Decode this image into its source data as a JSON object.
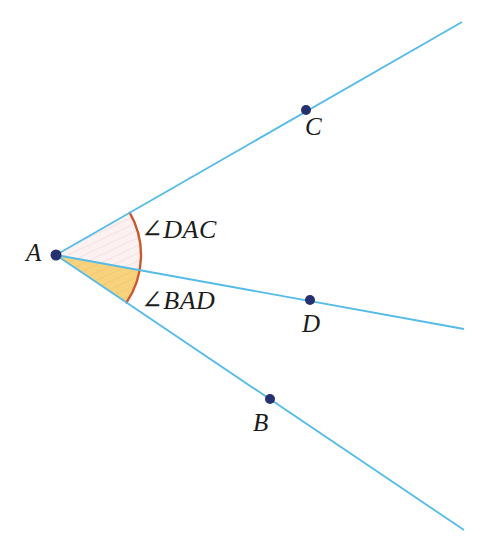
{
  "diagram": {
    "background": "#ffffff",
    "colors": {
      "ray": "#55bbe8",
      "point_dot": "#26316f",
      "arc": "#cb5a2e",
      "sector_dac_fill": "#fdf2f2",
      "sector_bad_fill": "#f8d37e",
      "label_text": "#1b1b1b"
    },
    "vertex": {
      "name": "A",
      "x": 56,
      "y": 255
    },
    "points": [
      {
        "name": "C",
        "x": 306,
        "y": 110
      },
      {
        "name": "D",
        "x": 310,
        "y": 300
      },
      {
        "name": "B",
        "x": 270,
        "y": 399
      }
    ],
    "rays": [
      {
        "name": "AC",
        "x1": 56,
        "y1": 255,
        "x2": 462,
        "y2": 22
      },
      {
        "name": "AD",
        "x1": 56,
        "y1": 255,
        "x2": 464,
        "y2": 329
      },
      {
        "name": "AB",
        "x1": 56,
        "y1": 255,
        "x2": 464,
        "y2": 530
      }
    ],
    "arc": {
      "radius": 85,
      "d": "M 129.7 212.7 A 85 85 0 0 1 126.5 302.5"
    },
    "sectors": [
      {
        "name": "DAC",
        "d": "M 56 255 L 129.7 212.7 A 85 85 0 0 1 139.6 270.2 Z"
      },
      {
        "name": "BAD",
        "d": "M 56 255 L 139.6 270.2 A 85 85 0 0 1 126.5 302.5 Z"
      }
    ],
    "labels": {
      "A": "A",
      "B": "B",
      "C": "C",
      "D": "D",
      "angle_dac": "∠DAC",
      "angle_bad": "∠BAD"
    }
  }
}
